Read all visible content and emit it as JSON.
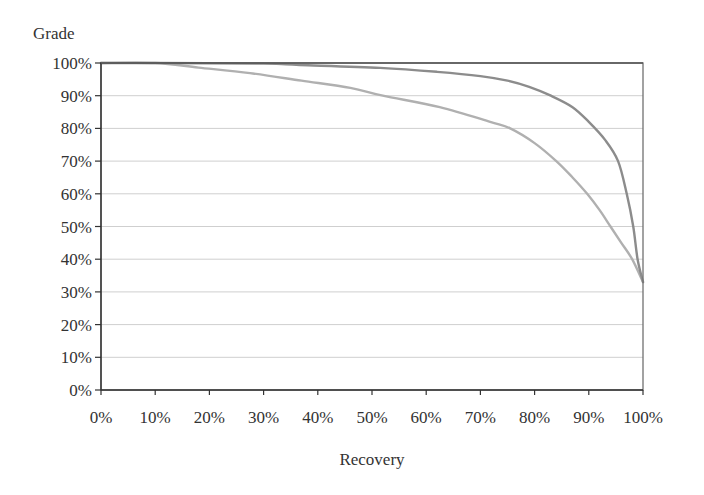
{
  "chart_data": {
    "type": "line",
    "title": "",
    "xlabel": "Recovery",
    "ylabel": "Grade",
    "xlim": [
      0,
      100
    ],
    "ylim": [
      0,
      100
    ],
    "x_ticks": [
      "0%",
      "10%",
      "20%",
      "30%",
      "40%",
      "50%",
      "60%",
      "70%",
      "80%",
      "90%",
      "100%"
    ],
    "y_ticks": [
      "0%",
      "10%",
      "20%",
      "30%",
      "40%",
      "50%",
      "60%",
      "70%",
      "80%",
      "90%",
      "100%"
    ],
    "grid": "horizontal",
    "legend": null,
    "series": [
      {
        "name": "upper curve",
        "color": "#8c8c8c",
        "points": [
          [
            0,
            100
          ],
          [
            10,
            100
          ],
          [
            30,
            99.8
          ],
          [
            36.7,
            99.4
          ],
          [
            51.5,
            98.5
          ],
          [
            62,
            97.3
          ],
          [
            70,
            96
          ],
          [
            75,
            94.6
          ],
          [
            79,
            92.7
          ],
          [
            83,
            90
          ],
          [
            87,
            86.5
          ],
          [
            90,
            82
          ],
          [
            93,
            76.5
          ],
          [
            95.4,
            70
          ],
          [
            97,
            60
          ],
          [
            98.2,
            50
          ],
          [
            99,
            40
          ],
          [
            100,
            33
          ]
        ]
      },
      {
        "name": "lower curve",
        "color": "#b0b0b0",
        "points": [
          [
            0,
            100
          ],
          [
            10,
            100
          ],
          [
            18,
            98.6
          ],
          [
            27.5,
            96.9
          ],
          [
            37,
            94.6
          ],
          [
            46,
            92.4
          ],
          [
            52,
            90
          ],
          [
            62.5,
            86.5
          ],
          [
            71.8,
            82
          ],
          [
            75.5,
            80
          ],
          [
            80,
            75.5
          ],
          [
            84,
            70
          ],
          [
            87,
            65
          ],
          [
            89.7,
            60
          ],
          [
            92,
            55
          ],
          [
            94,
            50
          ],
          [
            96,
            45
          ],
          [
            98,
            40
          ],
          [
            100,
            33
          ]
        ]
      }
    ]
  },
  "axes": {
    "x_title": "Recovery",
    "y_title": "Grade"
  },
  "colors": {
    "frame": "#707070",
    "grid": "#cfcfcf",
    "axis": "#333333"
  }
}
